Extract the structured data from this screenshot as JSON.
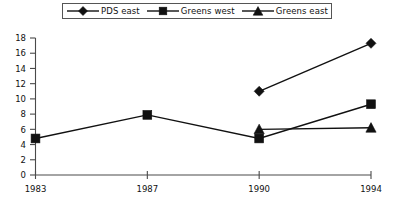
{
  "chart_data": {
    "type": "line",
    "title": "",
    "xlabel": "",
    "ylabel": "",
    "categories": [
      "1983",
      "1987",
      "1990",
      "1994"
    ],
    "x_tick_labels": [
      "1983",
      "1987",
      "1990",
      "1994"
    ],
    "y_tick_labels": [
      "0",
      "2",
      "4",
      "6",
      "8",
      "10",
      "12",
      "14",
      "16",
      "18"
    ],
    "ylim": [
      0,
      18
    ],
    "y_tick_step": 2,
    "grid": false,
    "legend_position": "top",
    "series": [
      {
        "name": "PDS east",
        "marker": "diamond",
        "color": "#111111",
        "values": [
          null,
          null,
          11.0,
          17.3
        ]
      },
      {
        "name": "Greens west",
        "marker": "square",
        "color": "#111111",
        "values": [
          4.8,
          7.9,
          4.8,
          9.3
        ]
      },
      {
        "name": "Greens east",
        "marker": "triangle",
        "color": "#111111",
        "values": [
          null,
          null,
          6.0,
          6.2
        ]
      }
    ]
  },
  "legend": {
    "entries": [
      {
        "label": "PDS east",
        "marker": "diamond-marker-icon"
      },
      {
        "label": "Greens west",
        "marker": "square-marker-icon"
      },
      {
        "label": "Greens east",
        "marker": "triangle-marker-icon"
      }
    ]
  },
  "axes": {
    "y_ticks": [
      "18",
      "16",
      "14",
      "12",
      "10",
      "8",
      "6",
      "4",
      "2",
      "0"
    ],
    "x_ticks": [
      "1983",
      "1987",
      "1990",
      "1994"
    ]
  },
  "colors": {
    "ink": "#111111",
    "axis": "#4a4a4a",
    "legend_border": "#555555",
    "background": "#ffffff"
  }
}
